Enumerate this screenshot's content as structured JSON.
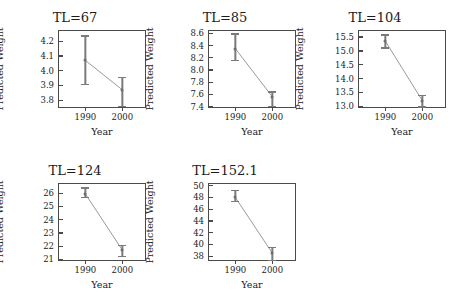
{
  "figure": {
    "layout": "3 columns x 2 rows, last cell empty",
    "background_color": "#ffffff",
    "frame_color": "#4a4a4a",
    "series_color": "#7a7a7a",
    "line_color": "#9a9a9a"
  },
  "chart_data": {
    "type": "line",
    "title": "",
    "xlabel": "Year",
    "ylabel": "Predicted Weight",
    "x": [
      "1990",
      "2000"
    ],
    "xlim": [
      -0.5,
      1.5
    ],
    "grid": false,
    "legend": "none",
    "panels": [
      {
        "title": "TL=67",
        "xlabel": "Year",
        "ylabel": "Predicted Weight",
        "categories": [
          "1990",
          "2000"
        ],
        "values": [
          4.07,
          3.87
        ],
        "ci_low": [
          3.91,
          3.76
        ],
        "ci_high": [
          4.24,
          3.96
        ],
        "ylim": [
          3.74,
          4.27
        ],
        "yticks": [
          "3.8",
          "3.9",
          "4.0",
          "4.1",
          "4.2"
        ],
        "ytick_values": [
          3.8,
          3.9,
          4.0,
          4.1,
          4.2
        ]
      },
      {
        "title": "TL=85",
        "xlabel": "Year",
        "ylabel": "Predicted Weight",
        "categories": [
          "1990",
          "2000"
        ],
        "values": [
          8.35,
          7.56
        ],
        "ci_low": [
          8.17,
          7.41
        ],
        "ci_high": [
          8.6,
          7.65
        ],
        "ylim": [
          7.36,
          8.64
        ],
        "yticks": [
          "7.4",
          "7.6",
          "7.8",
          "8.0",
          "8.2",
          "8.4",
          "8.6"
        ],
        "ytick_values": [
          7.4,
          7.6,
          7.8,
          8.0,
          8.2,
          8.4,
          8.6
        ]
      },
      {
        "title": "TL=104",
        "xlabel": "Year",
        "ylabel": "Predicted Weight",
        "categories": [
          "1990",
          "2000"
        ],
        "values": [
          15.35,
          13.2
        ],
        "ci_low": [
          15.13,
          13.0
        ],
        "ci_high": [
          15.6,
          13.42
        ],
        "ylim": [
          12.9,
          15.72
        ],
        "yticks": [
          "13.0",
          "13.5",
          "14.0",
          "14.5",
          "15.0",
          "15.5"
        ],
        "ytick_values": [
          13.0,
          13.5,
          14.0,
          14.5,
          15.0,
          15.5
        ]
      },
      {
        "title": "TL=124",
        "xlabel": "Year",
        "ylabel": "Predicted Weight",
        "categories": [
          "1990",
          "2000"
        ],
        "values": [
          25.95,
          21.7
        ],
        "ci_low": [
          25.72,
          21.25
        ],
        "ci_high": [
          26.45,
          22.12
        ],
        "ylim": [
          20.8,
          26.7
        ],
        "yticks": [
          "21",
          "22",
          "23",
          "24",
          "25",
          "26"
        ],
        "ytick_values": [
          21,
          22,
          23,
          24,
          25,
          26
        ]
      },
      {
        "title": "TL=152.1",
        "xlabel": "Year",
        "ylabel": "Predicted Weight",
        "categories": [
          "1990",
          "2000"
        ],
        "values": [
          48.0,
          38.5
        ],
        "ci_low": [
          47.45,
          37.4
        ],
        "ci_high": [
          49.3,
          39.6
        ],
        "ylim": [
          37.0,
          50.3
        ],
        "yticks": [
          "38",
          "40",
          "42",
          "44",
          "46",
          "48",
          "50"
        ],
        "ytick_values": [
          38,
          40,
          42,
          44,
          46,
          48,
          50
        ]
      }
    ]
  }
}
